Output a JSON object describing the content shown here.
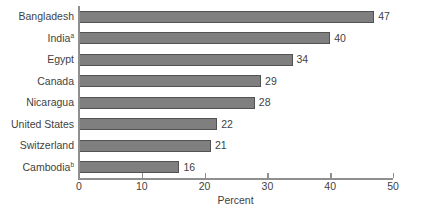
{
  "chart_data": {
    "type": "bar",
    "orientation": "horizontal",
    "title": "",
    "subtitle": "",
    "xlabel": "Percent",
    "ylabel": "",
    "xlim": [
      0,
      50
    ],
    "xticks": [
      0,
      10,
      20,
      30,
      40,
      50
    ],
    "xtick_labels": [
      "0",
      "10",
      "20",
      "30",
      "40",
      "50"
    ],
    "grid": false,
    "legend": false,
    "bar_color": "#7f7f7f",
    "bar_edge_color": "#525252",
    "axis_color": "#8f8f8f",
    "text_color": "#3f3f3f",
    "categories": [
      "Bangladesh",
      "India",
      "Egypt",
      "Canada",
      "Nicaragua",
      "United States",
      "Switzerland",
      "Cambodia"
    ],
    "values": [
      47,
      40,
      34,
      29,
      28,
      22,
      21,
      16
    ],
    "bars": [
      {
        "category": "Bangladesh",
        "footnote": "",
        "value": 47,
        "value_label": "47"
      },
      {
        "category": "India",
        "footnote": "a",
        "value": 40,
        "value_label": "40"
      },
      {
        "category": "Egypt",
        "footnote": "",
        "value": 34,
        "value_label": "34"
      },
      {
        "category": "Canada",
        "footnote": "",
        "value": 29,
        "value_label": "29"
      },
      {
        "category": "Nicaragua",
        "footnote": "",
        "value": 28,
        "value_label": "28"
      },
      {
        "category": "United States",
        "footnote": "",
        "value": 22,
        "value_label": "22"
      },
      {
        "category": "Switzerland",
        "footnote": "",
        "value": 21,
        "value_label": "21"
      },
      {
        "category": "Cambodia",
        "footnote": "b",
        "value": 16,
        "value_label": "16"
      }
    ]
  }
}
